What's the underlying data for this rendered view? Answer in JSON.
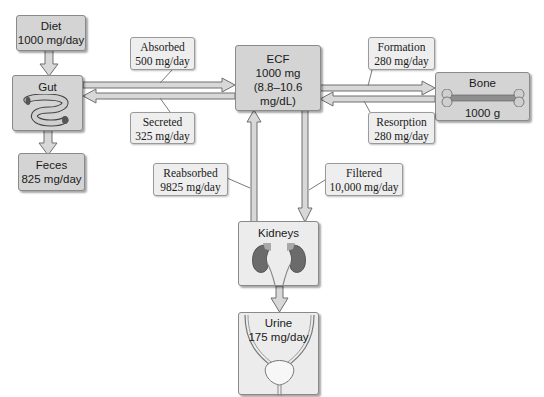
{
  "diagram": {
    "type": "calcium-balance-flow",
    "nodes": {
      "diet": {
        "title": "Diet",
        "value": "1000 mg/day"
      },
      "gut": {
        "title": "Gut",
        "icon": "intestine-icon"
      },
      "feces": {
        "title": "Feces",
        "value": "825 mg/day"
      },
      "ecf": {
        "title": "ECF",
        "value": "1000 mg",
        "range": "(8.8–10.6 mg/dL)"
      },
      "bone": {
        "title": "Bone",
        "value": "1000 g",
        "icon": "bone-icon"
      },
      "kidneys": {
        "title": "Kidneys",
        "icon": "kidneys-icon"
      },
      "urine": {
        "title": "Urine",
        "value": "175 mg/day",
        "icon": "bladder-icon"
      }
    },
    "flows": {
      "absorbed": {
        "label": "Absorbed",
        "value": "500 mg/day",
        "from": "gut",
        "to": "ecf"
      },
      "secreted": {
        "label": "Secreted",
        "value": "325 mg/day",
        "from": "ecf",
        "to": "gut"
      },
      "formation": {
        "label": "Formation",
        "value": "280 mg/day",
        "from": "ecf",
        "to": "bone"
      },
      "resorption": {
        "label": "Resorption",
        "value": "280 mg/day",
        "from": "bone",
        "to": "ecf"
      },
      "reabsorbed": {
        "label": "Reabsorbed",
        "value": "9825 mg/day",
        "from": "kidneys",
        "to": "ecf"
      },
      "filtered": {
        "label": "Filtered",
        "value": "10,000 mg/day",
        "from": "ecf",
        "to": "kidneys"
      },
      "intake": {
        "from": "diet",
        "to": "gut"
      },
      "excretion_gut": {
        "from": "gut",
        "to": "feces"
      },
      "excretion_kidney": {
        "from": "kidneys",
        "to": "urine"
      }
    },
    "colors": {
      "box_fill": "#d4d4d4",
      "box_light_fill": "#ececec",
      "callout_fill": "#eeeeee",
      "arrow_fill": "#d8d8d8",
      "arrow_stroke": "#6e6e6e",
      "kidney": "#6b6b6b",
      "background": "#ffffff"
    }
  }
}
